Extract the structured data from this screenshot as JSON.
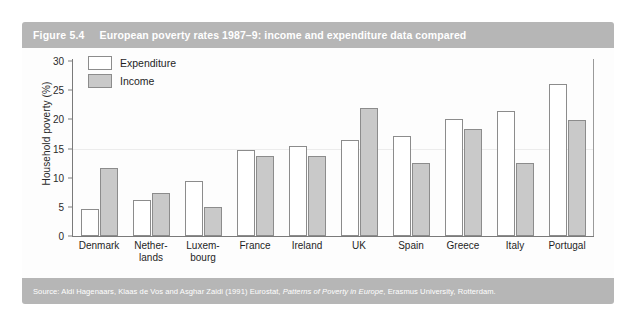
{
  "figure": {
    "number_label": "Figure 5.4",
    "title": "European poverty rates 1987–9: income and expenditure data compared",
    "header_bg": "#b6b6b6",
    "source_prefix": "Source: Aldi Hagenaars, Klaas de Vos and Asghar Zaidi (1991) Eurostat, ",
    "source_italic": "Patterns of Poverty in Europe",
    "source_suffix": ", Erasmus University, Rotterdam."
  },
  "legend": {
    "position": "top-left-inside",
    "items": [
      {
        "label": "Expenditure",
        "color": "#ffffff",
        "swatch_name": "expenditure-swatch"
      },
      {
        "label": "Income",
        "color": "#c9c9c9",
        "swatch_name": "income-swatch"
      }
    ]
  },
  "axes": {
    "ylabel": "Household poverty (%)",
    "yticks": [
      "30",
      "25",
      "20",
      "15",
      "10",
      "5",
      "0"
    ],
    "ytick_values": [
      30,
      25,
      20,
      15,
      10,
      5,
      0
    ],
    "ylim": [
      0,
      30
    ],
    "xlabel": ""
  },
  "chart_data": {
    "type": "bar",
    "title": "European poverty rates 1987–9: income and expenditure data compared",
    "xlabel": "",
    "ylabel": "Household poverty (%)",
    "ylim": [
      0,
      30
    ],
    "grid": false,
    "legend_position": "upper left",
    "categories": [
      "Denmark",
      "Nether-\nlands",
      "Luxem-\nbourg",
      "France",
      "Ireland",
      "UK",
      "Spain",
      "Greece",
      "Italy",
      "Portugal"
    ],
    "category_lines": [
      [
        "Denmark"
      ],
      [
        "Nether-",
        "lands"
      ],
      [
        "Luxem-",
        "bourg"
      ],
      [
        "France"
      ],
      [
        "Ireland"
      ],
      [
        "UK"
      ],
      [
        "Spain"
      ],
      [
        "Greece"
      ],
      [
        "Italy"
      ],
      [
        "Portugal"
      ]
    ],
    "series": [
      {
        "name": "Expenditure",
        "color": "#ffffff",
        "values": [
          4.6,
          6.2,
          9.4,
          14.8,
          15.5,
          16.5,
          17.1,
          20.0,
          21.4,
          26.1
        ]
      },
      {
        "name": "Income",
        "color": "#c9c9c9",
        "values": [
          11.7,
          7.4,
          5.0,
          13.7,
          13.8,
          22.0,
          12.6,
          18.3,
          12.5,
          19.9
        ]
      }
    ]
  }
}
